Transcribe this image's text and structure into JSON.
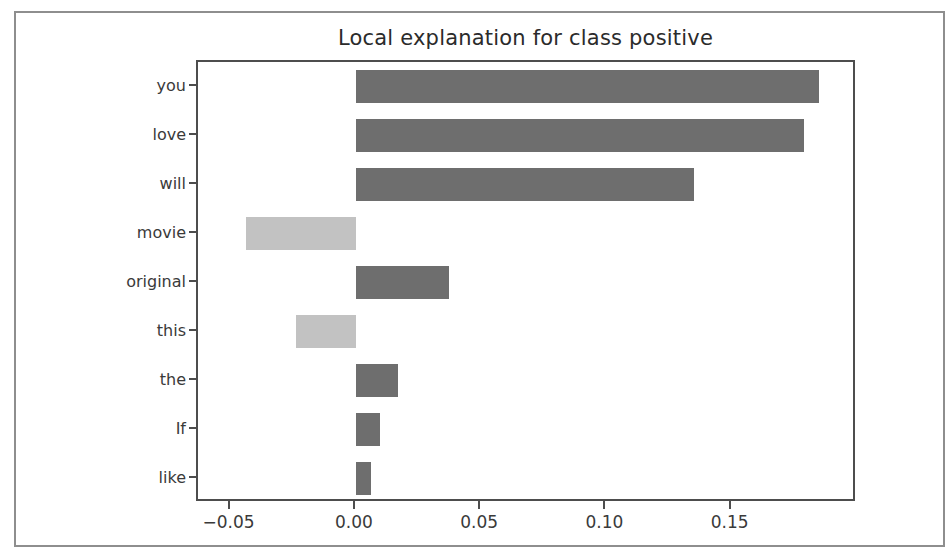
{
  "figure": {
    "title": "Local explanation for class positive",
    "background_color": "#ffffff",
    "frame_color": "#8e8e8e",
    "axis_color": "#4d4d4d"
  },
  "chart_data": {
    "type": "bar",
    "orientation": "horizontal",
    "title": "Local explanation for class positive",
    "xlabel": "",
    "ylabel": "",
    "categories": [
      "you",
      "love",
      "will",
      "movie",
      "original",
      "this",
      "the",
      "If",
      "like"
    ],
    "values": [
      0.185,
      0.179,
      0.135,
      -0.044,
      0.037,
      -0.024,
      0.017,
      0.0095,
      0.006
    ],
    "xlim": [
      -0.063,
      0.2
    ],
    "ylim": [
      -0.5,
      8.5
    ],
    "xticks": [
      -0.05,
      0.0,
      0.05,
      0.1,
      0.15
    ],
    "xtick_labels": [
      "−0.05",
      "0.00",
      "0.05",
      "0.10",
      "0.15"
    ],
    "ytick_labels": [
      "you",
      "love",
      "will",
      "movie",
      "original",
      "this",
      "the",
      "If",
      "like"
    ],
    "grid": false,
    "legend": null,
    "colors": {
      "positive": "#6e6e6e",
      "negative": "#c2c2c2"
    },
    "bars": [
      {
        "label": "you",
        "value": 0.185,
        "sign": "positive"
      },
      {
        "label": "love",
        "value": 0.179,
        "sign": "positive"
      },
      {
        "label": "will",
        "value": 0.135,
        "sign": "positive"
      },
      {
        "label": "movie",
        "value": -0.044,
        "sign": "negative"
      },
      {
        "label": "original",
        "value": 0.037,
        "sign": "positive"
      },
      {
        "label": "this",
        "value": -0.024,
        "sign": "negative"
      },
      {
        "label": "the",
        "value": 0.017,
        "sign": "positive"
      },
      {
        "label": "If",
        "value": 0.0095,
        "sign": "positive"
      },
      {
        "label": "like",
        "value": 0.006,
        "sign": "positive"
      }
    ]
  }
}
